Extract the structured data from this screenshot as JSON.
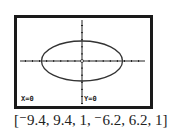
{
  "chart_data": {
    "type": "line",
    "title": "",
    "curve": {
      "shape": "ellipse",
      "center": [
        0,
        0
      ],
      "semi_axis_x": 6,
      "semi_axis_y": 3
    },
    "window": {
      "xmin": -9.4,
      "xmax": 9.4,
      "xscl": 1,
      "ymin": -6.2,
      "ymax": 6.2,
      "yscl": 1
    },
    "xlim": [
      -9.4,
      9.4
    ],
    "ylim": [
      -6.2,
      6.2
    ],
    "grid": false,
    "xlabel": "",
    "ylabel": ""
  },
  "screen": {
    "cursor_x_label": "X=0",
    "cursor_y_label": "Y=0"
  },
  "caption": "[⁻9.4, 9.4, 1, ⁻6.2, 6.2, 1]",
  "colors": {
    "ink": "#1a1a1a",
    "screen": "#ffffff"
  }
}
